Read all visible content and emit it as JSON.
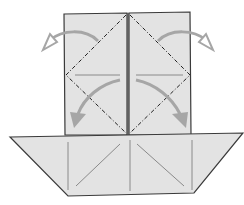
{
  "diagram": {
    "type": "origami-step",
    "colors": {
      "paper": "#e3e3e3",
      "edge": "#3a3a3a",
      "crease": "#8a8a8a",
      "arrow": "#a6a6a6",
      "background": "#ffffff"
    },
    "elements": {
      "top_flaps": 2,
      "dashed_fold_lines": 4,
      "outward_arrows": 2,
      "downward_arrows": 2
    }
  }
}
